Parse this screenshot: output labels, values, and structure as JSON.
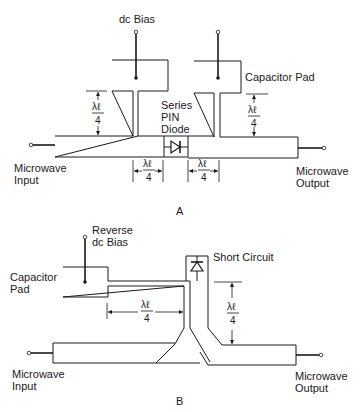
{
  "diagram_a": {
    "label": "A",
    "dc_bias": "dc Bias",
    "capacitor_pad": "Capacitor Pad",
    "series_pin_diode": [
      "Series",
      "PIN",
      "Diode"
    ],
    "microwave_input": [
      "Microwave",
      "Input"
    ],
    "microwave_output": [
      "Microwave",
      "Output"
    ],
    "quarter_wave": {
      "num": "λℓ",
      "den": "4"
    }
  },
  "diagram_b": {
    "label": "B",
    "reverse_dc_bias": [
      "Reverse",
      "dc Bias"
    ],
    "capacitor_pad": [
      "Capacitor",
      "Pad"
    ],
    "short_circuit": "Short Circuit",
    "microwave_input": [
      "Microwave",
      "Input"
    ],
    "microwave_output": [
      "Microwave",
      "Output"
    ],
    "quarter_wave": {
      "num": "λℓ",
      "den": "4"
    }
  }
}
